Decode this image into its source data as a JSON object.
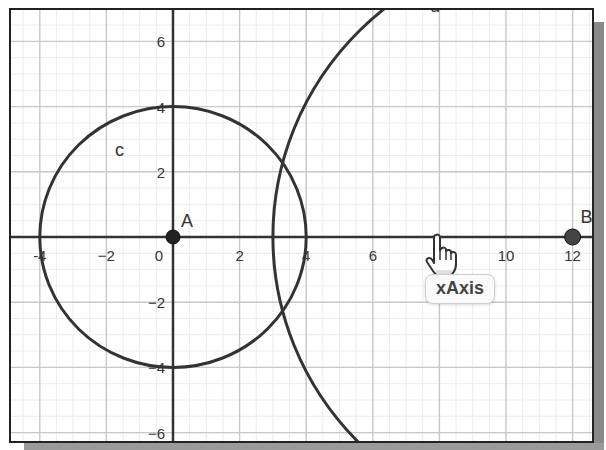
{
  "app": "Geometry graphics view",
  "view": {
    "origin_px": [
      173,
      237
    ],
    "scale_px": [
      33.3,
      32.6
    ],
    "x_range": [
      -4.9,
      12.6
    ],
    "y_range": [
      -6.3,
      7.0
    ],
    "major_grid_step": 2,
    "minor_grid_step": 0.5,
    "axis_color": "#333333",
    "grid_major_color": "#c8c8c8",
    "grid_minor_color": "#ececec"
  },
  "axes": {
    "x_ticks": [
      {
        "value": -4,
        "label": "-4"
      },
      {
        "value": -2,
        "label": "−2"
      },
      {
        "value": 0,
        "label": "0"
      },
      {
        "value": 2,
        "label": "2"
      },
      {
        "value": 4,
        "label": "4"
      },
      {
        "value": 6,
        "label": "6"
      },
      {
        "value": 10,
        "label": "10"
      },
      {
        "value": 12,
        "label": "12"
      }
    ],
    "y_ticks": [
      {
        "value": 6,
        "label": "6"
      },
      {
        "value": 4,
        "label": "4"
      },
      {
        "value": 2,
        "label": "2"
      },
      {
        "value": -2,
        "label": "−2"
      },
      {
        "value": -4,
        "label": "−4"
      },
      {
        "value": -6,
        "label": "−6"
      }
    ]
  },
  "objects": {
    "points": [
      {
        "name": "A",
        "label": "A",
        "x": 0,
        "y": 0,
        "color": "#222222"
      },
      {
        "name": "B",
        "label": "B",
        "x": 12,
        "y": 0,
        "color": "#444444"
      }
    ],
    "circles": [
      {
        "name": "c",
        "label": "c",
        "center": "A",
        "cx": 0,
        "cy": 0,
        "r": 4,
        "color": "#333333"
      },
      {
        "name": "d",
        "label": "d",
        "center": "B",
        "cx": 12,
        "cy": 0,
        "r": 9,
        "color": "#333333"
      }
    ]
  },
  "hover": {
    "tooltip_text": "xAxis",
    "cursor": "hand-pointer"
  }
}
